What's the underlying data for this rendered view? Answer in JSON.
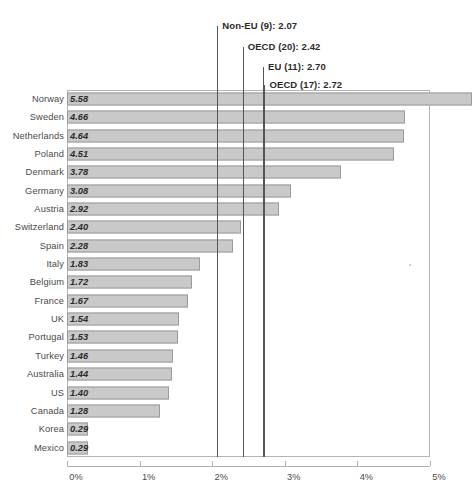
{
  "chart_data": {
    "type": "bar",
    "orientation": "horizontal",
    "title": "",
    "subtitle": "",
    "xlabel": "",
    "ylabel": "",
    "xlim": [
      0,
      5
    ],
    "xtick_labels": [
      "0%",
      "1%",
      "2%",
      "3%",
      "4%",
      "5%"
    ],
    "xtick_values": [
      0,
      1,
      2,
      3,
      4,
      5
    ],
    "grid": false,
    "legend": "none",
    "value_label_format": "two-decimal-italic-bold",
    "categories": [
      "Norway",
      "Sweden",
      "Netherlands",
      "Poland",
      "Denmark",
      "Germany",
      "Austria",
      "Switzerland",
      "Spain",
      "Italy",
      "Belgium",
      "France",
      "UK",
      "Portugal",
      "Turkey",
      "Australia",
      "US",
      "Canada",
      "Korea",
      "Mexico"
    ],
    "values": [
      5.58,
      4.66,
      4.64,
      4.51,
      3.78,
      3.08,
      2.92,
      2.4,
      2.28,
      1.83,
      1.72,
      1.67,
      1.54,
      1.53,
      1.46,
      1.44,
      1.4,
      1.28,
      0.29,
      0.29
    ],
    "value_labels": [
      "5.58",
      "4.66",
      "4.64",
      "4.51",
      "3.78",
      "3.08",
      "2.92",
      "2.40",
      "2.28",
      "1.83",
      "1.72",
      "1.67",
      "1.54",
      "1.53",
      "1.46",
      "1.44",
      "1.40",
      "1.28",
      "0.29",
      "0.29"
    ],
    "reference_lines": [
      {
        "label": "Non-EU (9): 2.07",
        "value": 2.07
      },
      {
        "label": "OECD (20): 2.42",
        "value": 2.42
      },
      {
        "label": "EU (11): 2.70",
        "value": 2.7
      },
      {
        "label": "OECD (17): 2.72",
        "value": 2.72
      }
    ],
    "colors": {
      "bar_fill": "#c9c9c9",
      "bar_border": "#9a9a9a",
      "reference_line": "#555555",
      "axis": "#b0b0b0",
      "text": "#4a4a4a",
      "background": "#ffffff"
    }
  }
}
